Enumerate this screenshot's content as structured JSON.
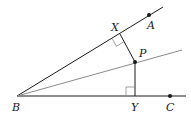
{
  "diagram": {
    "type": "geometry",
    "labels": {
      "A": "A",
      "B": "B",
      "C": "C",
      "P": "P",
      "X": "X",
      "Y": "Y"
    },
    "points": {
      "B": [
        17,
        96
      ],
      "A": [
        149,
        15
      ],
      "C": [
        170,
        96
      ],
      "P": [
        135,
        62
      ],
      "X": [
        120,
        34
      ],
      "Y": [
        135,
        96
      ]
    },
    "segments": [
      {
        "name": "ray-BA",
        "from": "B",
        "to": [
          163,
          7
        ],
        "color": "#1a1a1a"
      },
      {
        "name": "ray-BC",
        "from": "B",
        "to": [
          186,
          96
        ],
        "color": "#1a1a1a"
      },
      {
        "name": "bisector-BP",
        "from": "B",
        "to": [
          182,
          50
        ],
        "color": "#8a8a8a"
      },
      {
        "name": "perpendicular-PX",
        "from": "P",
        "to": "X",
        "color": "#1a1a1a"
      },
      {
        "name": "perpendicular-PY",
        "from": "P",
        "to": "Y",
        "color": "#1a1a1a"
      }
    ],
    "right_angle_marks": [
      "X",
      "Y"
    ],
    "colors": {
      "line": "#1a1a1a",
      "bisector": "#8a8a8a",
      "right_angle_mark": "#8a8a8a"
    }
  }
}
